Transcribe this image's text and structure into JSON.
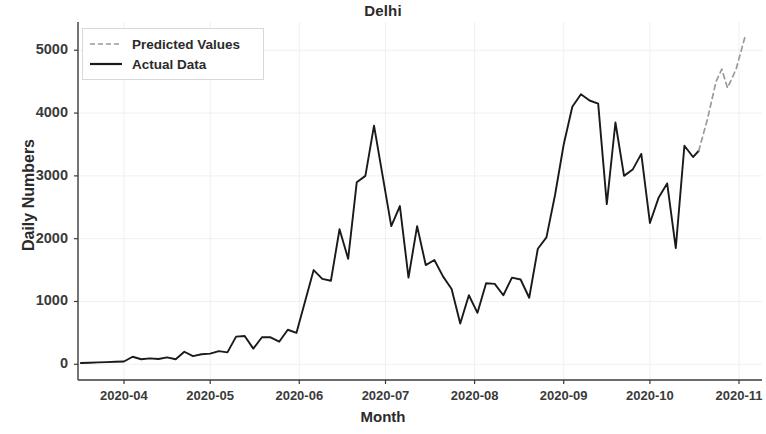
{
  "chart_data": {
    "type": "line",
    "title": "Delhi",
    "xlabel": "Month",
    "ylabel": "Daily Numbers",
    "grid": true,
    "legend_position": "upper left",
    "xtick_labels": [
      "2020-04",
      "2020-05",
      "2020-06",
      "2020-07",
      "2020-08",
      "2020-09",
      "2020-10",
      "2020-11"
    ],
    "ytick_labels": [
      "0",
      "1000",
      "2000",
      "3000",
      "4000",
      "5000"
    ],
    "ylim": [
      -250,
      5450
    ],
    "xlim": [
      "2020-03-16",
      "2020-11-09"
    ],
    "colors": {
      "actual": "#1a1a1a",
      "predicted": "#9a9a9a",
      "background": "#ffffff",
      "grid": "#f0f0f0"
    },
    "series": [
      {
        "name": "Actual Data",
        "style": "solid",
        "color": "#1a1a1a",
        "points": [
          [
            "2020-03-17",
            20
          ],
          [
            "2020-03-20",
            25
          ],
          [
            "2020-03-23",
            30
          ],
          [
            "2020-03-26",
            35
          ],
          [
            "2020-03-29",
            40
          ],
          [
            "2020-04-01",
            45
          ],
          [
            "2020-04-04",
            120
          ],
          [
            "2020-04-07",
            80
          ],
          [
            "2020-04-10",
            95
          ],
          [
            "2020-04-13",
            85
          ],
          [
            "2020-04-16",
            110
          ],
          [
            "2020-04-19",
            80
          ],
          [
            "2020-04-22",
            200
          ],
          [
            "2020-04-25",
            130
          ],
          [
            "2020-04-28",
            160
          ],
          [
            "2020-05-01",
            170
          ],
          [
            "2020-05-04",
            210
          ],
          [
            "2020-05-07",
            190
          ],
          [
            "2020-05-10",
            440
          ],
          [
            "2020-05-13",
            450
          ],
          [
            "2020-05-16",
            250
          ],
          [
            "2020-05-19",
            430
          ],
          [
            "2020-05-22",
            430
          ],
          [
            "2020-05-25",
            360
          ],
          [
            "2020-05-28",
            550
          ],
          [
            "2020-05-31",
            500
          ],
          [
            "2020-06-03",
            1000
          ],
          [
            "2020-06-06",
            1500
          ],
          [
            "2020-06-09",
            1360
          ],
          [
            "2020-06-12",
            1330
          ],
          [
            "2020-06-15",
            2150
          ],
          [
            "2020-06-18",
            1680
          ],
          [
            "2020-06-21",
            2900
          ],
          [
            "2020-06-24",
            3000
          ],
          [
            "2020-06-27",
            3800
          ],
          [
            "2020-06-30",
            3000
          ],
          [
            "2020-07-03",
            2200
          ],
          [
            "2020-07-06",
            2520
          ],
          [
            "2020-07-09",
            1380
          ],
          [
            "2020-07-12",
            2200
          ],
          [
            "2020-07-15",
            1580
          ],
          [
            "2020-07-18",
            1660
          ],
          [
            "2020-07-21",
            1400
          ],
          [
            "2020-07-24",
            1200
          ],
          [
            "2020-07-27",
            650
          ],
          [
            "2020-07-30",
            1100
          ],
          [
            "2020-08-02",
            820
          ],
          [
            "2020-08-05",
            1290
          ],
          [
            "2020-08-08",
            1280
          ],
          [
            "2020-08-11",
            1100
          ],
          [
            "2020-08-14",
            1380
          ],
          [
            "2020-08-17",
            1350
          ],
          [
            "2020-08-20",
            1060
          ],
          [
            "2020-08-23",
            1840
          ],
          [
            "2020-08-26",
            2020
          ],
          [
            "2020-08-29",
            2700
          ],
          [
            "2020-09-01",
            3500
          ],
          [
            "2020-09-04",
            4100
          ],
          [
            "2020-09-07",
            4300
          ],
          [
            "2020-09-10",
            4200
          ],
          [
            "2020-09-13",
            4150
          ],
          [
            "2020-09-16",
            2550
          ],
          [
            "2020-09-19",
            3850
          ],
          [
            "2020-09-22",
            3000
          ],
          [
            "2020-09-25",
            3100
          ],
          [
            "2020-09-28",
            3350
          ],
          [
            "2020-10-01",
            2250
          ],
          [
            "2020-10-04",
            2650
          ],
          [
            "2020-10-07",
            2880
          ],
          [
            "2020-10-10",
            1850
          ],
          [
            "2020-10-13",
            3480
          ],
          [
            "2020-10-16",
            3300
          ],
          [
            "2020-10-18",
            3400
          ]
        ]
      },
      {
        "name": "Predicted Values",
        "style": "dashed",
        "color": "#9a9a9a",
        "points": [
          [
            "2020-10-18",
            3400
          ],
          [
            "2020-10-21",
            3900
          ],
          [
            "2020-10-24",
            4500
          ],
          [
            "2020-10-26",
            4700
          ],
          [
            "2020-10-28",
            4400
          ],
          [
            "2020-10-31",
            4700
          ],
          [
            "2020-11-03",
            5200
          ]
        ]
      }
    ]
  },
  "legend": {
    "items": [
      {
        "label": "Predicted Values",
        "style": "dashed"
      },
      {
        "label": "Actual Data",
        "style": "solid"
      }
    ]
  }
}
